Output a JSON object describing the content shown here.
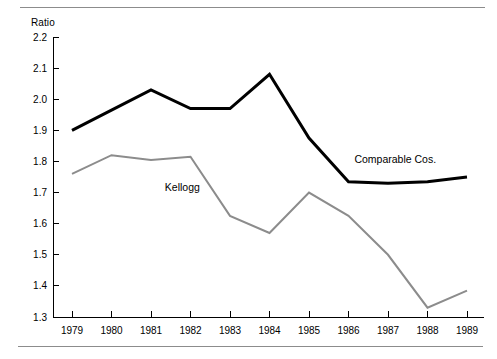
{
  "chart_data": {
    "type": "line",
    "title": "",
    "xlabel": "",
    "ylabel": "Ratio",
    "categories": [
      "1979",
      "1980",
      "1981",
      "1982",
      "1983",
      "1984",
      "1985",
      "1986",
      "1987",
      "1988",
      "1989"
    ],
    "ylim": [
      1.3,
      2.2
    ],
    "ytick_labels": [
      "2.2",
      "2.1",
      "2.0",
      "1.9",
      "1.8",
      "1.7",
      "1.6",
      "1.5",
      "1.4",
      "1.3"
    ],
    "ytick_values": [
      2.2,
      2.1,
      2.0,
      1.9,
      1.8,
      1.7,
      1.6,
      1.5,
      1.4,
      1.3
    ],
    "grid": false,
    "legend_position": "inline-annotation",
    "series": [
      {
        "name": "Comparable Cos.",
        "color": "#000000",
        "line_width": 3,
        "label_x": 1986.15,
        "label_y": 1.795,
        "values": [
          1.9,
          1.965,
          2.03,
          1.97,
          1.97,
          2.08,
          1.875,
          1.735,
          1.73,
          1.735,
          1.75
        ]
      },
      {
        "name": "Kellogg",
        "color": "#8c8c8c",
        "line_width": 2,
        "label_x": 1981.35,
        "label_y": 1.705,
        "values": [
          1.76,
          1.82,
          1.805,
          1.815,
          1.625,
          1.57,
          1.7,
          1.625,
          1.5,
          1.33,
          1.385
        ]
      }
    ]
  }
}
